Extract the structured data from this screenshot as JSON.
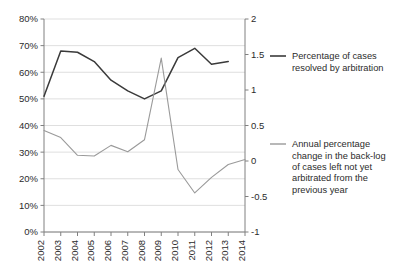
{
  "chart_data": {
    "type": "line",
    "title": "",
    "subtitle": "",
    "xlabel": "",
    "ylabel": "",
    "grid": true,
    "legend_position": "right",
    "categories": [
      "2002",
      "2003",
      "2004",
      "2005",
      "2006",
      "2007",
      "2008",
      "2009",
      "2010",
      "2011",
      "2012",
      "2013",
      "2014"
    ],
    "axes": {
      "left": {
        "label": "",
        "ylim": [
          0,
          80
        ],
        "ticks": [
          0,
          10,
          20,
          30,
          40,
          50,
          60,
          70,
          80
        ],
        "tick_labels": [
          "0%",
          "10%",
          "20%",
          "30%",
          "40%",
          "50%",
          "60%",
          "70%",
          "80%"
        ],
        "format": "percent"
      },
      "right": {
        "label": "",
        "ylim": [
          -1,
          2
        ],
        "ticks": [
          -1,
          -0.5,
          0,
          0.5,
          1,
          1.5,
          2
        ],
        "tick_labels": [
          "-1",
          "-0.5",
          "0",
          "0.5",
          "1",
          "1.5",
          "2"
        ],
        "format": "number"
      }
    },
    "series": [
      {
        "name": "Percentage of cases resolved by arbitration",
        "axis": "left",
        "color": "#3a3a3a",
        "x": [
          "2002",
          "2003",
          "2004",
          "2005",
          "2006",
          "2007",
          "2008",
          "2009",
          "2010",
          "2011",
          "2012",
          "2013"
        ],
        "values": [
          51,
          68,
          67.5,
          64,
          57,
          53,
          50,
          53,
          65.5,
          69,
          63,
          64
        ]
      },
      {
        "name": "Annual percentage change in the back-log of cases left not yet arbitrated from the previous year",
        "axis": "right",
        "color": "#9a9a9a",
        "x": [
          "2002",
          "2003",
          "2004",
          "2005",
          "2006",
          "2007",
          "2008",
          "2009",
          "2010",
          "2011",
          "2012",
          "2013",
          "2014"
        ],
        "values": [
          0.43,
          0.33,
          0.08,
          0.07,
          0.22,
          0.13,
          0.3,
          1.45,
          -0.12,
          -0.45,
          -0.23,
          -0.05,
          0.02
        ]
      }
    ],
    "legend": [
      {
        "label_lines": [
          "Percentage of cases",
          "resolved by arbitration"
        ],
        "color": "#3a3a3a",
        "swatch": "line-swatch-primary"
      },
      {
        "label_lines": [
          "Annual percentage",
          "change in the back-log",
          "of cases left not yet",
          "arbitrated from the",
          "previous year"
        ],
        "color": "#9a9a9a",
        "swatch": "line-swatch-secondary"
      }
    ]
  }
}
